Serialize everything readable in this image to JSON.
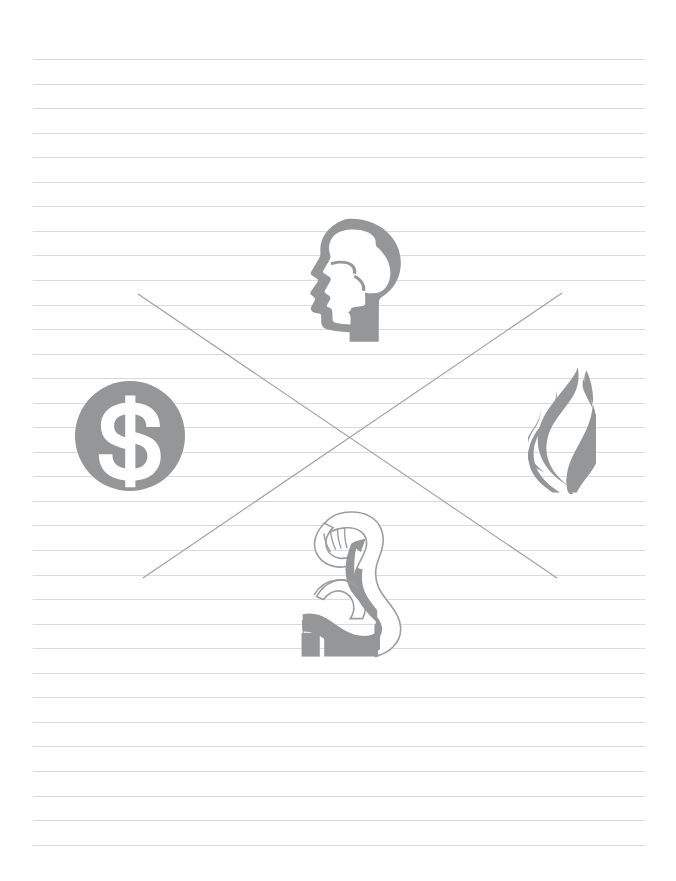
{
  "page": {
    "background_color": "#ffffff",
    "width": 676,
    "height": 881
  },
  "paper": {
    "name": "ruled-notebook-paper",
    "line_color": "#d9dbdd",
    "line_left": 33,
    "line_right": 645,
    "line_spacing": 24.55,
    "first_line_y": 59,
    "line_count": 33
  },
  "cross_overlay": {
    "name": "x-cross-strikethrough",
    "color": "#9b9fa3",
    "stroke_width": 1.1,
    "lines": [
      {
        "x1": 138,
        "y1": 294,
        "x2": 557,
        "y2": 578
      },
      {
        "x1": 562,
        "y1": 293,
        "x2": 143,
        "y2": 578
      }
    ]
  },
  "icons": [
    {
      "id": "brain-head",
      "label": "Head with Brain",
      "semantic": "brain-head-icon",
      "color": "#949698",
      "x": 292,
      "y": 218,
      "width": 110,
      "height": 124,
      "position": "top-center"
    },
    {
      "id": "dollar-coin",
      "label": "Dollar Coin",
      "semantic": "dollar-coin-icon",
      "color": "#949698",
      "symbol": "$",
      "x": 75,
      "y": 381,
      "width": 110,
      "height": 110,
      "position": "left-center"
    },
    {
      "id": "flame",
      "label": "Flame",
      "semantic": "flame-icon",
      "color": "#949698",
      "x": 528,
      "y": 367,
      "width": 68,
      "height": 127,
      "position": "right-center"
    },
    {
      "id": "flexed-bicep",
      "label": "Flexed Bicep Arm",
      "semantic": "flexed-bicep-icon",
      "color": "#949698",
      "x": 298,
      "y": 510,
      "width": 104,
      "height": 148,
      "position": "bottom-center"
    }
  ]
}
